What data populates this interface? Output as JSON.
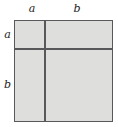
{
  "figure": {
    "kind": "geometric-diagram",
    "colors": {
      "fill": "#dededd",
      "stroke": "#58585a",
      "label_text": "#1c1c1c",
      "background": "#ffffff"
    },
    "square": {
      "side_segments_top": [
        "a",
        "b"
      ],
      "side_segments_left": [
        "a",
        "b"
      ]
    },
    "labels": {
      "top_left": "a",
      "top_right": "b",
      "left_upper": "a",
      "left_lower": "b"
    }
  },
  "chart_data": {
    "type": "diagram",
    "title": "",
    "shape": "square",
    "partition": {
      "vertical_divisions": [
        "a",
        "b"
      ],
      "horizontal_divisions": [
        "a",
        "b"
      ],
      "regions": [
        {
          "row": "a",
          "col": "a",
          "area": "a*a"
        },
        {
          "row": "a",
          "col": "b",
          "area": "a*b"
        },
        {
          "row": "b",
          "col": "a",
          "area": "a*b"
        },
        {
          "row": "b",
          "col": "b",
          "area": "b*b"
        }
      ]
    },
    "tick_labels_top": [
      "a",
      "b"
    ],
    "tick_labels_left": [
      "a",
      "b"
    ]
  }
}
